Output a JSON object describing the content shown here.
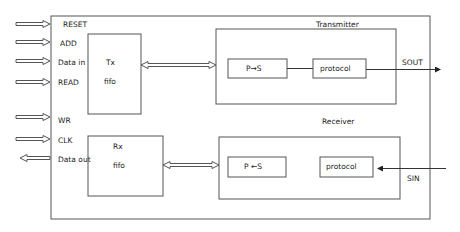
{
  "diagram": {
    "outer_box": {
      "x": 51,
      "y": 16,
      "w": 379,
      "h": 203
    },
    "signals": [
      {
        "label": "RESET",
        "y": 24,
        "lx": 62,
        "ly": 26,
        "dir": "in"
      },
      {
        "label": "ADD",
        "y": 42,
        "lx": 60,
        "ly": 46,
        "dir": "in"
      },
      {
        "label": "Data in",
        "y": 61,
        "lx": 58,
        "ly": 65,
        "dir": "in"
      },
      {
        "label": "READ",
        "y": 82,
        "lx": 58,
        "ly": 85,
        "dir": "in"
      },
      {
        "label": "WR",
        "y": 117,
        "lx": 58,
        "ly": 123,
        "dir": "in"
      },
      {
        "label": "CLK",
        "y": 139,
        "lx": 58,
        "ly": 143,
        "dir": "in"
      },
      {
        "label": "Data out",
        "y": 158,
        "lx": 58,
        "ly": 162,
        "dir": "out"
      }
    ],
    "tx_fifo": {
      "x": 88,
      "y": 34,
      "w": 53,
      "h": 80,
      "line1": "Tx",
      "line2": "fifo"
    },
    "rx_fifo": {
      "x": 88,
      "y": 136,
      "w": 75,
      "h": 60,
      "line1": "Rx",
      "line2": "fifo"
    },
    "transmitter": {
      "label": "Transmitter",
      "x": 216,
      "y": 29,
      "w": 180,
      "h": 75
    },
    "receiver": {
      "label": "Receiver",
      "x": 219,
      "y": 137,
      "w": 181,
      "h": 62
    },
    "p_to_s": {
      "label": "P→S",
      "x": 228,
      "y": 59,
      "w": 59,
      "h": 19
    },
    "tx_protocol": {
      "label": "protocol",
      "x": 313,
      "y": 59,
      "w": 53,
      "h": 19
    },
    "s_to_p": {
      "label": "P ←S",
      "x": 228,
      "y": 157,
      "w": 58,
      "h": 20
    },
    "rx_protocol": {
      "label": "protocol",
      "x": 320,
      "y": 157,
      "w": 53,
      "h": 20
    },
    "sout": {
      "label": "SOUT"
    },
    "sin": {
      "label": "SIN"
    }
  }
}
